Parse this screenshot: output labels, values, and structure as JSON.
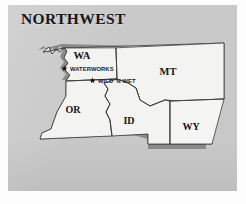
{
  "figure": {
    "kind": "regional-map-illustration",
    "background_color": "#fdfdfd",
    "panel_color": "#c9c9c9",
    "land_fill": "#f2f2f0",
    "shadow_color": "#8c8c8c",
    "outline_color": "#3b3b3b",
    "text_color": "#16161a"
  },
  "title": {
    "text": "NORTHWEST"
  },
  "map": {
    "region_name": "Northwest",
    "states": [
      {
        "code": "WA",
        "name": "Washington",
        "label_x": 82,
        "label_y": 56
      },
      {
        "code": "MT",
        "name": "Montana",
        "label_x": 168,
        "label_y": 72
      },
      {
        "code": "OR",
        "name": "Oregon",
        "label_x": 73,
        "label_y": 110
      },
      {
        "code": "ID",
        "name": "Idaho",
        "label_x": 129,
        "label_y": 121
      },
      {
        "code": "WY",
        "name": "Wyoming",
        "label_x": 190,
        "label_y": 127
      }
    ],
    "sites": [
      {
        "name": "WATERWORKS",
        "marker": "star-marker",
        "marker_x": 64.5,
        "marker_y": 68.5,
        "label_x": 70,
        "label_y": 71.5,
        "state": "WA"
      },
      {
        "name": "WILD 'N WET",
        "marker": "star-marker",
        "marker_x": 92.5,
        "marker_y": 80.5,
        "label_x": 98,
        "label_y": 83.5,
        "state": "WA"
      }
    ]
  }
}
